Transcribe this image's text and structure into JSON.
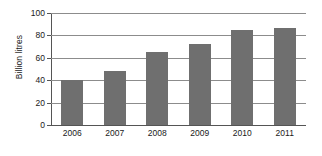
{
  "chart_data": {
    "type": "bar",
    "title": "",
    "xlabel": "",
    "ylabel": "Billion litres",
    "categories": [
      "2006",
      "2007",
      "2008",
      "2009",
      "2010",
      "2011"
    ],
    "values": [
      40,
      48,
      65,
      72,
      85,
      87
    ],
    "series": [
      {
        "name": "Billion litres",
        "values": [
          40,
          48,
          65,
          72,
          85,
          87
        ]
      }
    ],
    "ylim": [
      0,
      100
    ],
    "yticks": [
      0,
      20,
      40,
      60,
      80,
      100
    ],
    "ytick_labels": [
      "0",
      "20",
      "40",
      "60",
      "80",
      "100"
    ],
    "grid": true,
    "grid_axis": "y",
    "legend": false,
    "legend_position": "none",
    "bar_color": "#6f6f6f",
    "gridline_color": "#8c8c8c",
    "axis_color": "#555555",
    "background_color": "#ffffff",
    "text_color": "#1a1a1a"
  }
}
